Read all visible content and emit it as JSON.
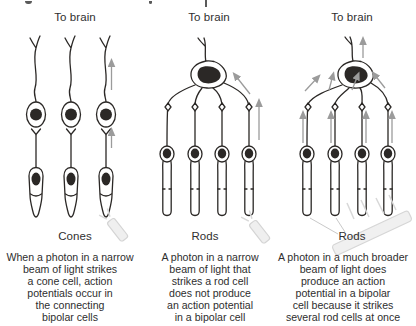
{
  "figure": {
    "panels": [
      {
        "to_brain_label": "To brain",
        "cell_type_label": "Cones",
        "caption": "When a photon in a narrow\nbeam of light strikes\na cone cell, action\npotentials occur in\nthe connecting\nbipolar cells"
      },
      {
        "to_brain_label": "To brain",
        "cell_type_label": "Rods",
        "caption": "A photon in a narrow\nbeam of light that\nstrikes a rod cell\ndoes not produce\nan action potential\nin a bipolar cell"
      },
      {
        "to_brain_label": "To brain",
        "cell_type_label": "Rods",
        "caption": "A photon in a much broader\nbeam of light does\nproduce an action\npotential in a bipolar\ncell because it strikes\nseveral rod cells at once"
      }
    ],
    "colors": {
      "ink": "#2b2826",
      "arrow": "#9b9b9b",
      "beam_fill": "#efefef",
      "beam_stroke": "#d4d4d4"
    }
  }
}
